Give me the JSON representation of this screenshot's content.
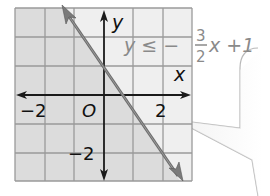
{
  "graph": {
    "x_axis_label": "x",
    "y_axis_label": "y",
    "origin_label": "O",
    "tick_labels": {
      "x_neg": "−2",
      "x_pos": "2",
      "y_neg": "−2"
    },
    "inequality": {
      "lhs": "y ≤ −",
      "numerator": "3",
      "denominator": "2",
      "rhs": "x +1"
    },
    "colors": {
      "shaded_region": "#dcdcdc",
      "unshaded_region": "#efefef",
      "grid_line": "#9a9a9a",
      "boundary_line": "#6e6e6e",
      "axis": "#1a1a1a",
      "inequality_text": "#8a8a8a"
    }
  },
  "callout": {
    "shape": "speech-bubble-pointer"
  }
}
